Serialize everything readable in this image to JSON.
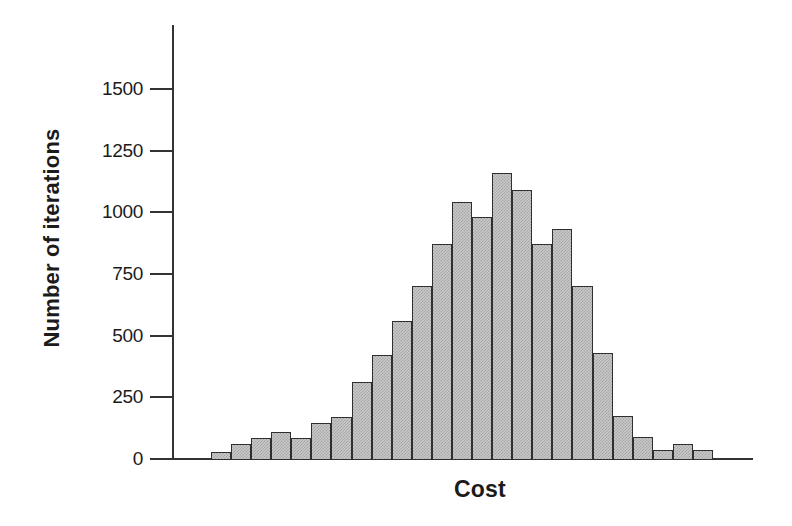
{
  "chart_data": {
    "type": "bar",
    "subtype": "histogram",
    "title": "",
    "xlabel": "Cost",
    "ylabel": "Number of iterations",
    "x_tick_labels": [],
    "yticks": [
      0,
      250,
      500,
      750,
      1000,
      1250,
      1500
    ],
    "ylim": [
      0,
      1760
    ],
    "grid": false,
    "legend": false,
    "values": [
      30,
      60,
      85,
      110,
      85,
      145,
      170,
      310,
      420,
      560,
      700,
      870,
      1040,
      980,
      1160,
      1090,
      870,
      930,
      700,
      430,
      175,
      90,
      35,
      60,
      35
    ],
    "colors": {
      "bar_fill": "#c9c9c9",
      "bar_dot": "#a6a6a6",
      "bar_border": "#2f2f2f",
      "axis": "#333333",
      "text": "#1b1b1b",
      "background": "#ffffff"
    }
  }
}
